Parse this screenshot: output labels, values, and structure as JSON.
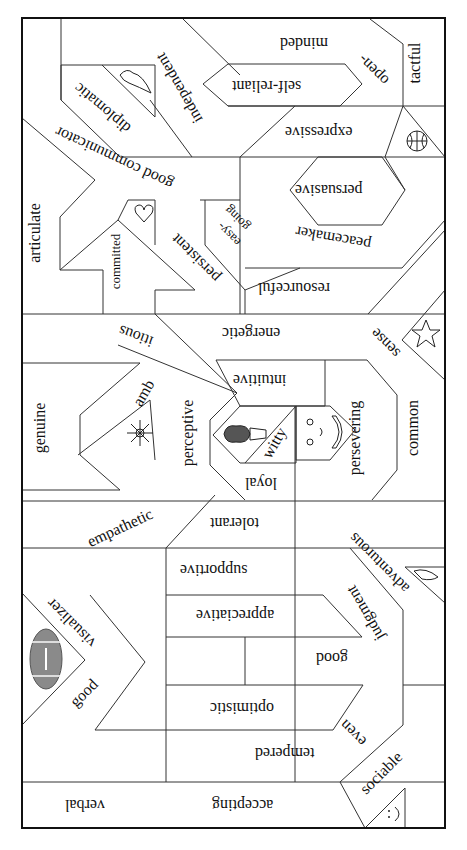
{
  "diagram": {
    "type": "word-jigsaw-puzzle",
    "orientation_note": "most words rendered upside down",
    "colors": {
      "line": "#333333",
      "border": "#111111",
      "text": "#111111",
      "football": "#8a8a8a"
    },
    "pieces": [
      {
        "id": "tactful",
        "text": "tactful"
      },
      {
        "id": "open-minded-1",
        "text": "open-"
      },
      {
        "id": "open-minded-2",
        "text": "minded"
      },
      {
        "id": "self-reliant",
        "text": "self-reliant"
      },
      {
        "id": "independent",
        "text": "independent"
      },
      {
        "id": "diplomatic",
        "text": "diplomatic"
      },
      {
        "id": "good-communicator",
        "text": "good communicator"
      },
      {
        "id": "expressive",
        "text": "expressive"
      },
      {
        "id": "persuasive",
        "text": "persuasive"
      },
      {
        "id": "peacemaker",
        "text": "peacemaker"
      },
      {
        "id": "articulate",
        "text": "articulate"
      },
      {
        "id": "committed",
        "text": "committed"
      },
      {
        "id": "persistent",
        "text": "persistent"
      },
      {
        "id": "easy-going-1",
        "text": "easy-"
      },
      {
        "id": "easy-going-2",
        "text": "going"
      },
      {
        "id": "resourceful",
        "text": "resourceful"
      },
      {
        "id": "energetic",
        "text": "energetic"
      },
      {
        "id": "ambitious-1",
        "text": "amb"
      },
      {
        "id": "ambitious-2",
        "text": "itious"
      },
      {
        "id": "common-sense-1",
        "text": "common"
      },
      {
        "id": "common-sense-2",
        "text": "sense"
      },
      {
        "id": "intuitive",
        "text": "intuitive"
      },
      {
        "id": "genuine",
        "text": "genuine"
      },
      {
        "id": "perceptive",
        "text": "perceptive"
      },
      {
        "id": "witty",
        "text": "witty"
      },
      {
        "id": "persevering",
        "text": "persevering"
      },
      {
        "id": "loyal",
        "text": "loyal"
      },
      {
        "id": "empathetic",
        "text": "empathetic"
      },
      {
        "id": "tolerant",
        "text": "tolerant"
      },
      {
        "id": "adventurous",
        "text": "adventurous"
      },
      {
        "id": "supportive",
        "text": "supportive"
      },
      {
        "id": "good-visualizer-1",
        "text": "visualizer"
      },
      {
        "id": "good-visualizer-2",
        "text": "good"
      },
      {
        "id": "appreciative",
        "text": "appreciative"
      },
      {
        "id": "good-judgment-1",
        "text": "good"
      },
      {
        "id": "good-judgment-2",
        "text": "judgment"
      },
      {
        "id": "optimistic",
        "text": "optimistic"
      },
      {
        "id": "even-tempered-1",
        "text": "even"
      },
      {
        "id": "even-tempered-2",
        "text": "tempered"
      },
      {
        "id": "sociable",
        "text": "sociable"
      },
      {
        "id": "verbal",
        "text": "verbal"
      },
      {
        "id": "accepting",
        "text": "accepting"
      }
    ],
    "icons": [
      {
        "name": "bird-icon",
        "near": "diplomatic"
      },
      {
        "name": "basketball-icon",
        "near": "expressive"
      },
      {
        "name": "heart-icon",
        "near": "committed"
      },
      {
        "name": "star-icon",
        "near": "common sense"
      },
      {
        "name": "flower-icon",
        "near": "empathetic"
      },
      {
        "name": "ice-cream-cone-icon",
        "near": "witty"
      },
      {
        "name": "smiley-face-icon",
        "near": "persevering"
      },
      {
        "name": "dolphin-icon",
        "near": "adventurous"
      },
      {
        "name": "football-icon",
        "near": "good visualizer"
      },
      {
        "name": "small-smiley-icon",
        "near": "sociable"
      }
    ]
  }
}
